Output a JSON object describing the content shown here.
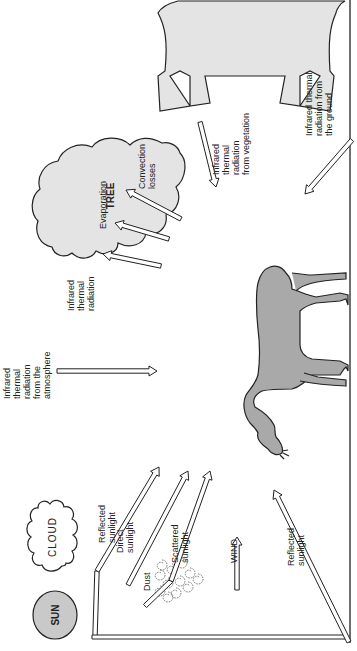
{
  "diagram": {
    "colors": {
      "background": "#ffffff",
      "ink": "#222222",
      "sun_fill": "#c9c9c9",
      "tree_fill": "#e4e4e4",
      "horse_fill": "#a9a9a9",
      "cloud_fill": "#ffffff"
    },
    "objects": {
      "sun": "SUN",
      "cloud": "CLOUD",
      "tree": "TREE",
      "dust": "Dust",
      "wind": "WIND",
      "animal": "horse"
    },
    "labels": {
      "reflected_sunlight_cloud": [
        "Reflected",
        "sunlight"
      ],
      "direct_sunlight": [
        "Direct",
        "sunlight"
      ],
      "scattered_sunlight": [
        "Scattered",
        "sunlight"
      ],
      "reflected_sunlight_ground": [
        "Reflected",
        "sunlight"
      ],
      "ir_atmosphere": [
        "Infrared",
        "thermal",
        "radiation",
        "from  the",
        "atmosphere"
      ],
      "ir_animal": [
        "Infrared",
        "thermal",
        "radiation"
      ],
      "evaporation": [
        "Evaporation"
      ],
      "convection": [
        "Convection",
        "losses"
      ],
      "ir_vegetation": [
        "Infrared",
        "thermal",
        "radiation",
        "from  vegetation"
      ],
      "ir_ground": [
        "Infrared  thermal",
        "radiation  from",
        "the  ground"
      ]
    },
    "arrows": [
      {
        "id": "sun-to-cloud",
        "from": "sun",
        "to": "cloud",
        "kind": "incoming-shortwave"
      },
      {
        "id": "cloud-reflected",
        "from": "cloud",
        "to": "animal",
        "kind": "reflected-shortwave"
      },
      {
        "id": "direct",
        "from": "sun",
        "to": "animal",
        "kind": "direct-shortwave"
      },
      {
        "id": "sun-to-dust",
        "from": "sun",
        "to": "dust",
        "kind": "incoming-shortwave"
      },
      {
        "id": "scattered",
        "from": "dust",
        "to": "animal",
        "kind": "scattered-shortwave"
      },
      {
        "id": "sun-to-ground",
        "from": "sun",
        "to": "ground",
        "kind": "incoming-shortwave"
      },
      {
        "id": "ground-reflected",
        "from": "ground",
        "to": "animal",
        "kind": "reflected-shortwave"
      },
      {
        "id": "wind",
        "from": "wind",
        "to": "animal",
        "kind": "convection"
      },
      {
        "id": "ir-atmosphere",
        "from": "atmosphere",
        "to": "animal",
        "kind": "longwave-in"
      },
      {
        "id": "ir-animal",
        "from": "animal",
        "to": "sky",
        "kind": "longwave-out"
      },
      {
        "id": "evaporation",
        "from": "animal",
        "to": "sky",
        "kind": "evaporative-loss"
      },
      {
        "id": "convection",
        "from": "animal",
        "to": "sky",
        "kind": "convective-loss"
      },
      {
        "id": "ir-vegetation",
        "from": "tree",
        "to": "animal",
        "kind": "longwave-in"
      },
      {
        "id": "ir-ground",
        "from": "ground",
        "to": "animal",
        "kind": "longwave-in"
      }
    ]
  }
}
